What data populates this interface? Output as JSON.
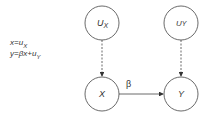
{
  "equations": {
    "line1": {
      "lhs": "x=u",
      "sub": "X"
    },
    "line2": {
      "lhs": "y=βx+u",
      "sub": "Y"
    }
  },
  "nodes": {
    "ux": {
      "main": "U",
      "sub": "X"
    },
    "uy": {
      "main": "U",
      "sub": "Y"
    },
    "x": {
      "label": "X"
    },
    "y": {
      "label": "Y"
    }
  },
  "edges": {
    "x_to_y": {
      "label": "β",
      "style": "solid"
    },
    "ux_to_x": {
      "style": "dashed"
    },
    "uy_to_y": {
      "style": "dashed"
    }
  },
  "colors": {
    "stroke": "#333333",
    "text": "#333333",
    "background": "#ffffff"
  }
}
